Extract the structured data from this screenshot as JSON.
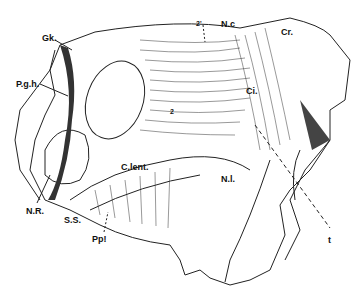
{
  "figure": {
    "labels": [
      {
        "id": "gk",
        "text": "Gk.",
        "x": 42,
        "y": 34
      },
      {
        "id": "pgh",
        "text": "P.g.h.",
        "x": 16,
        "y": 80
      },
      {
        "id": "nr",
        "text": "N.R.",
        "x": 26,
        "y": 207
      },
      {
        "id": "ss",
        "text": "S.S.",
        "x": 64,
        "y": 216
      },
      {
        "id": "pp",
        "text": "Pp!",
        "x": 92,
        "y": 235
      },
      {
        "id": "clent",
        "text": "C.lent.",
        "x": 121,
        "y": 163
      },
      {
        "id": "nl",
        "text": "N.l.",
        "x": 221,
        "y": 175
      },
      {
        "id": "nc",
        "text": "N.c",
        "x": 221,
        "y": 20
      },
      {
        "id": "cr",
        "text": "Cr.",
        "x": 281,
        "y": 28
      },
      {
        "id": "ci",
        "text": "Ci.",
        "x": 246,
        "y": 87
      },
      {
        "id": "two_top",
        "text": "2'",
        "x": 196,
        "y": 20
      },
      {
        "id": "two_mid",
        "text": "2",
        "x": 170,
        "y": 108
      },
      {
        "id": "t",
        "text": "t",
        "x": 328,
        "y": 236
      }
    ]
  }
}
